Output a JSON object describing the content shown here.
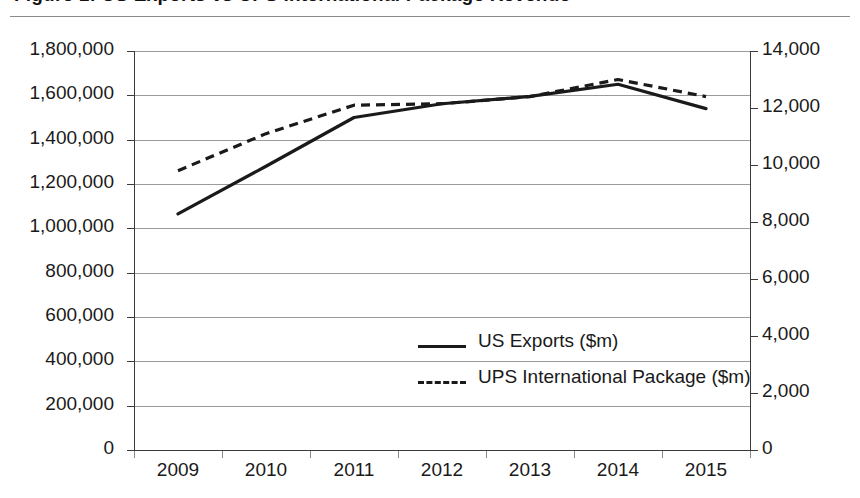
{
  "title": "Figure 1: US Exports vs UPS International Package Revenue",
  "chart_data": {
    "type": "line",
    "title": "Figure 1: US Exports vs UPS International Package Revenue",
    "xlabel": "",
    "ylabel": "",
    "categories": [
      "2009",
      "2010",
      "2011",
      "2012",
      "2013",
      "2014",
      "2015"
    ],
    "grid": true,
    "legend_position": "center",
    "axes": {
      "left": {
        "label": "",
        "ylim": [
          0,
          1800000
        ],
        "tick_step": 200000,
        "ticks": [
          "0",
          "200,000",
          "400,000",
          "600,000",
          "800,000",
          "1,000,000",
          "1,200,000",
          "1,400,000",
          "1,600,000",
          "1,800,000"
        ],
        "tick_values": [
          0,
          200000,
          400000,
          600000,
          800000,
          1000000,
          1200000,
          1400000,
          1600000,
          1800000
        ]
      },
      "right": {
        "label": "",
        "ylim": [
          0,
          14000
        ],
        "tick_step": 2000,
        "ticks": [
          "0",
          "2,000",
          "4,000",
          "6,000",
          "8,000",
          "10,000",
          "12,000",
          "14,000"
        ],
        "tick_values": [
          0,
          2000,
          4000,
          6000,
          8000,
          10000,
          12000,
          14000
        ]
      }
    },
    "series": [
      {
        "name": "US Exports ($m)",
        "axis": "left",
        "style": "solid",
        "color": "#1a1a1a",
        "values": [
          1065000,
          1280000,
          1500000,
          1562000,
          1595000,
          1650000,
          1540000
        ]
      },
      {
        "name": "UPS International Package ($m)",
        "axis": "right",
        "style": "dashed",
        "color": "#1a1a1a",
        "values": [
          9800,
          11100,
          12100,
          12150,
          12400,
          13000,
          12400
        ]
      }
    ]
  },
  "legend": [
    {
      "label": "US Exports ($m)",
      "style": "solid"
    },
    {
      "label": "UPS International Package ($m)",
      "style": "dashed"
    }
  ]
}
